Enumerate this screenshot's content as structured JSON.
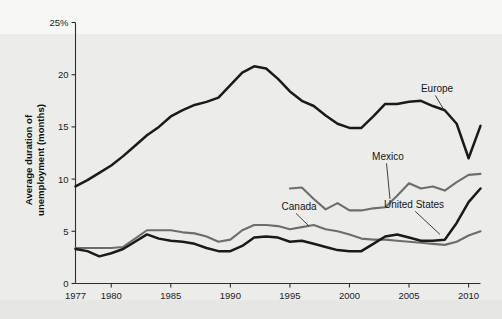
{
  "chart_data": {
    "type": "line",
    "title": "",
    "xlabel": "",
    "ylabel": "Average duration of unemployment (months)",
    "ylabel_line1": "Average duration of",
    "ylabel_line2": "unemployment (months)",
    "xlim": [
      1977,
      2011
    ],
    "ylim": [
      0,
      25
    ],
    "grid": false,
    "legend_position": "inline-annotations",
    "y_ticks": [
      0,
      5,
      10,
      15,
      20,
      25
    ],
    "y_tick_labels": [
      "0",
      "5",
      "10",
      "15",
      "20",
      "25%"
    ],
    "x_ticks": [
      1977,
      1980,
      1985,
      1990,
      1995,
      2000,
      2005,
      2010
    ],
    "x_tick_labels": [
      "1977",
      "1980",
      "1985",
      "1990",
      "1995",
      "2000",
      "2005",
      "2010"
    ],
    "series": [
      {
        "name": "Europe",
        "color": "#1a1a1a",
        "label_x": 2005.4,
        "label_y": 17.6,
        "x": [
          1977,
          1978,
          1979,
          1980,
          1981,
          1982,
          1983,
          1984,
          1985,
          1986,
          1987,
          1988,
          1989,
          1990,
          1991,
          1992,
          1993,
          1994,
          1995,
          1996,
          1997,
          1998,
          1999,
          2000,
          2001,
          2002,
          2003,
          2004,
          2005,
          2006,
          2007,
          2008,
          2009,
          2010,
          2011
        ],
        "values": [
          9.3,
          9.9,
          10.6,
          11.3,
          12.2,
          13.2,
          14.2,
          15.0,
          16.0,
          16.6,
          17.1,
          17.4,
          17.8,
          19.0,
          20.2,
          20.8,
          20.6,
          19.6,
          18.4,
          17.5,
          17.0,
          16.1,
          15.3,
          14.9,
          14.9,
          16.0,
          17.2,
          17.2,
          17.4,
          17.5,
          17.0,
          16.6,
          15.3,
          12.0,
          15.1
        ]
      },
      {
        "name": "Mexico",
        "color": "#6d6d6d",
        "label_x": 2001.6,
        "label_y": 11.6,
        "x": [
          1995,
          1996,
          1997,
          1998,
          1999,
          2000,
          2001,
          2002,
          2003,
          2004,
          2005,
          2006,
          2007,
          2008,
          2009,
          2010,
          2011
        ],
        "values": [
          9.1,
          9.2,
          8.1,
          7.1,
          7.7,
          7.0,
          7.0,
          7.2,
          7.3,
          8.4,
          9.6,
          9.1,
          9.3,
          8.9,
          9.7,
          10.4,
          10.5
        ]
      },
      {
        "name": "Canada",
        "color": "#6d6d6d",
        "label_x": 1995.2,
        "label_y": 6.5,
        "x": [
          1977,
          1978,
          1979,
          1980,
          1981,
          1982,
          1983,
          1984,
          1985,
          1986,
          1987,
          1988,
          1989,
          1990,
          1991,
          1992,
          1993,
          1994,
          1995,
          1996,
          1997,
          1998,
          1999,
          2000,
          2001,
          2002,
          2003,
          2004,
          2005,
          2006,
          2007,
          2008,
          2009,
          2010,
          2011
        ],
        "values": [
          3.4,
          3.4,
          3.4,
          3.4,
          3.5,
          4.3,
          5.1,
          5.1,
          5.1,
          4.9,
          4.8,
          4.5,
          4.0,
          4.2,
          5.1,
          5.6,
          5.6,
          5.5,
          5.2,
          5.4,
          5.6,
          5.2,
          5.0,
          4.7,
          4.3,
          4.2,
          4.2,
          4.1,
          4.0,
          3.9,
          3.8,
          3.7,
          4.0,
          4.6,
          5.0
        ]
      },
      {
        "name": "United States",
        "color": "#1a1a1a",
        "label_x": 2002.8,
        "label_y": 7.0,
        "x": [
          1977,
          1978,
          1979,
          1980,
          1981,
          1982,
          1983,
          1984,
          1985,
          1986,
          1987,
          1988,
          1989,
          1990,
          1991,
          1992,
          1993,
          1994,
          1995,
          1996,
          1997,
          1998,
          1999,
          2000,
          2001,
          2002,
          2003,
          2004,
          2005,
          2006,
          2007,
          2008,
          2009,
          2010,
          2011
        ],
        "values": [
          3.3,
          3.1,
          2.6,
          2.9,
          3.3,
          4.0,
          4.7,
          4.3,
          4.1,
          4.0,
          3.8,
          3.4,
          3.1,
          3.1,
          3.6,
          4.4,
          4.5,
          4.4,
          4.0,
          4.1,
          3.8,
          3.5,
          3.2,
          3.1,
          3.1,
          3.8,
          4.5,
          4.7,
          4.4,
          4.1,
          4.1,
          4.2,
          5.8,
          7.8,
          9.1
        ]
      }
    ],
    "annotations": [
      {
        "text": "Europe",
        "leader": true
      },
      {
        "text": "Mexico",
        "leader": true
      },
      {
        "text": "Canada",
        "leader": true
      },
      {
        "text": "United States",
        "leader": true
      }
    ]
  }
}
